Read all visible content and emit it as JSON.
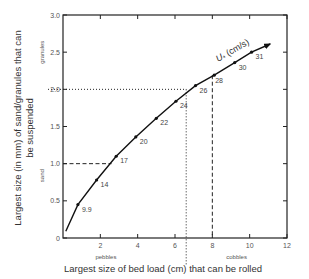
{
  "chart_data": {
    "type": "line",
    "title": "",
    "xlabel": "Largest size of bed load (cm) that can be rolled",
    "ylabel": "Largest size (in mm) of sand/granules that can be suspended",
    "xlim": [
      0,
      12
    ],
    "ylim": [
      0,
      3.0
    ],
    "x_ticks": [
      "2",
      "4",
      "6",
      "8",
      "10",
      "12"
    ],
    "y_ticks": [
      "0",
      "0.5",
      "1.0",
      "1.5",
      "2.0",
      "2.5",
      "3.0"
    ],
    "grid": false,
    "series": [
      {
        "name": "U* (cm/s)",
        "points": [
          {
            "x": 0.15,
            "y": 0.09,
            "label": ""
          },
          {
            "x": 0.8,
            "y": 0.45,
            "label": "9.9"
          },
          {
            "x": 1.8,
            "y": 0.78,
            "label": "14"
          },
          {
            "x": 2.85,
            "y": 1.1,
            "label": "17"
          },
          {
            "x": 3.9,
            "y": 1.36,
            "label": "20"
          },
          {
            "x": 5.0,
            "y": 1.61,
            "label": "22"
          },
          {
            "x": 6.05,
            "y": 1.84,
            "label": "24"
          },
          {
            "x": 7.1,
            "y": 2.05,
            "label": "26"
          },
          {
            "x": 8.1,
            "y": 2.19,
            "label": "28"
          },
          {
            "x": 9.2,
            "y": 2.36,
            "label": "30"
          },
          {
            "x": 10.1,
            "y": 2.5,
            "label": "31"
          },
          {
            "x": 11.1,
            "y": 2.61,
            "label": ""
          }
        ]
      }
    ],
    "annotations": {
      "curve_label": "U",
      "curve_label_sub": "*",
      "curve_label_units": "(cm/s)",
      "y_categories": [
        {
          "label": "sand",
          "range": [
            0,
            2.0
          ]
        },
        {
          "label": "granules",
          "range": [
            2.0,
            3.0
          ]
        }
      ],
      "x_categories": [
        {
          "label": "pebbles",
          "range": [
            0,
            6.6
          ]
        },
        {
          "label": "cobbles",
          "range": [
            6.6,
            12
          ]
        }
      ],
      "reference_lines": [
        {
          "style": "dashed",
          "y": 1.0,
          "x": 2.6
        },
        {
          "style": "dotted",
          "y": 2.0,
          "x": 6.6
        },
        {
          "style": "dashed",
          "x": 8.0,
          "y": 2.19
        }
      ]
    }
  }
}
